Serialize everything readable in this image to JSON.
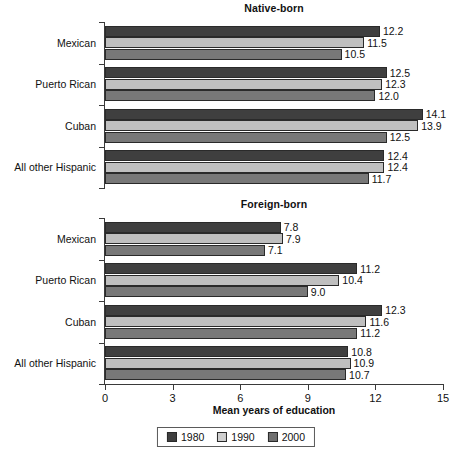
{
  "chart_data": {
    "type": "bar",
    "orientation": "horizontal",
    "title": "",
    "xlabel": "Mean years of education",
    "ylabel": "",
    "xlim": [
      0,
      15
    ],
    "xticks": [
      0,
      3,
      6,
      9,
      12,
      15
    ],
    "xtick_labels": [
      "0",
      "3",
      "6",
      "9",
      "12",
      "15"
    ],
    "grid": false,
    "legend_position": "bottom",
    "legend_entries": [
      "1980",
      "1990",
      "2000"
    ],
    "series_colors": {
      "1980": "#3f3f3f",
      "1990": "#bfbfbf",
      "2000": "#787878"
    },
    "panels": [
      {
        "title": "Native-born",
        "categories": [
          "Mexican",
          "Puerto Rican",
          "Cuban",
          "All other Hispanic"
        ],
        "series": [
          {
            "name": "1980",
            "values": [
              12.2,
              12.5,
              14.1,
              12.4
            ],
            "labels": [
              "12.2",
              "12.5",
              "14.1",
              "12.4"
            ]
          },
          {
            "name": "1990",
            "values": [
              11.5,
              12.3,
              13.9,
              12.4
            ],
            "labels": [
              "11.5",
              "12.3",
              "13.9",
              "12.4"
            ]
          },
          {
            "name": "2000",
            "values": [
              10.5,
              12.0,
              12.5,
              11.7
            ],
            "labels": [
              "10.5",
              "12.0",
              "12.5",
              "11.7"
            ]
          }
        ]
      },
      {
        "title": "Foreign-born",
        "categories": [
          "Mexican",
          "Puerto Rican",
          "Cuban",
          "All other Hispanic"
        ],
        "series": [
          {
            "name": "1980",
            "values": [
              7.8,
              11.2,
              12.3,
              10.8
            ],
            "labels": [
              "7.8",
              "11.2",
              "12.3",
              "10.8"
            ]
          },
          {
            "name": "1990",
            "values": [
              7.9,
              10.4,
              11.6,
              10.9
            ],
            "labels": [
              "7.9",
              "10.4",
              "11.6",
              "10.9"
            ]
          },
          {
            "name": "2000",
            "values": [
              7.1,
              9.0,
              11.2,
              10.7
            ],
            "labels": [
              "7.1",
              "9.0",
              "11.2",
              "10.7"
            ]
          }
        ]
      }
    ]
  }
}
